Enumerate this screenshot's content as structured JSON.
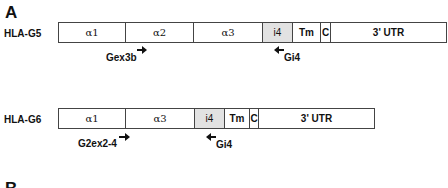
{
  "panels": {
    "a_label": "A",
    "b_label": "B"
  },
  "rows": [
    {
      "name": "HLA-G5",
      "segments": [
        {
          "label": "α1",
          "width": 67
        },
        {
          "label": "α2",
          "width": 68
        },
        {
          "label": "α3",
          "width": 69
        },
        {
          "label": "i4",
          "width": 30,
          "shaded": true
        },
        {
          "label": "Tm",
          "width": 28
        },
        {
          "label": "C",
          "width": 10
        },
        {
          "label": "3' UTR",
          "width": 117
        }
      ],
      "primers": [
        {
          "label": "Gex3b",
          "direction": "forward"
        },
        {
          "label": "Gi4",
          "direction": "reverse"
        }
      ]
    },
    {
      "name": "HLA-G6",
      "segments": [
        {
          "label": "α1",
          "width": 67
        },
        {
          "label": "α3",
          "width": 69
        },
        {
          "label": "i4",
          "width": 30,
          "shaded": true
        },
        {
          "label": "Tm",
          "width": 25
        },
        {
          "label": "C",
          "width": 9
        },
        {
          "label": "3' UTR",
          "width": 117
        }
      ],
      "primers": [
        {
          "label": "G2ex2-4",
          "direction": "forward"
        },
        {
          "label": "Gi4",
          "direction": "reverse"
        }
      ]
    }
  ],
  "colors": {
    "border": "#444444",
    "intron_fill": "#e2e2e2",
    "text": "#111111"
  }
}
